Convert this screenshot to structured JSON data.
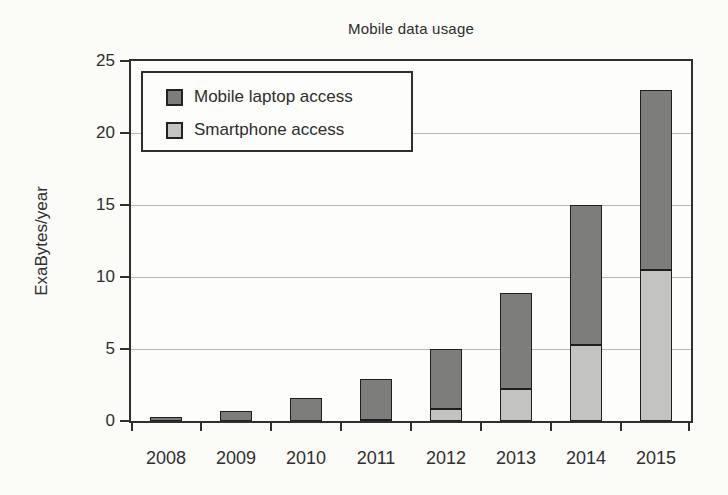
{
  "chart_data": {
    "type": "bar",
    "stacked": true,
    "title": "Mobile data usage",
    "xlabel": "",
    "ylabel": "ExaBytes/year",
    "categories": [
      "2008",
      "2009",
      "2010",
      "2011",
      "2012",
      "2013",
      "2014",
      "2015"
    ],
    "series": [
      {
        "name": "Smartphone access",
        "key": "smartphone-access",
        "color": "#c3c3c1",
        "values": [
          0,
          0,
          0,
          0.1,
          0.8,
          2.2,
          5.3,
          10.5
        ]
      },
      {
        "name": "Mobile laptop access",
        "key": "mobile-laptop-access",
        "color": "#7d7d7b",
        "values": [
          0.3,
          0.7,
          1.6,
          2.8,
          4.2,
          6.7,
          9.7,
          12.5
        ]
      }
    ],
    "stack_totals": [
      0.3,
      0.7,
      1.6,
      2.9,
      5.0,
      8.9,
      15.0,
      23.0
    ],
    "ylim": [
      0,
      25
    ],
    "yticks": [
      0,
      5,
      10,
      15,
      20,
      25
    ],
    "gridlines": [
      5,
      10,
      15,
      20
    ],
    "grid": "horizontal",
    "legend_position": "upper-left-inside"
  },
  "legend": {
    "items": [
      {
        "label": "Mobile laptop access",
        "color": "#7d7d7b"
      },
      {
        "label": "Smartphone access",
        "color": "#c3c3c1"
      }
    ]
  },
  "colors": {
    "frame": "#2f2f2f",
    "gridline": "#b6b6b2",
    "background": "#fbfbf8",
    "plot_background": "#fdfdfb",
    "bar_border": "#1e1e1e",
    "text": "#2f2f2f"
  }
}
